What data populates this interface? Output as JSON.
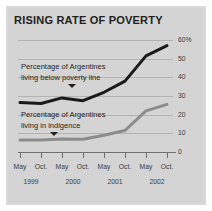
{
  "title": "RISING RATE OF POVERTY",
  "colors": {
    "panel_background": "#d4d4d4",
    "poverty_line": "#1a1a1a",
    "indigence_line": "#8c8c8c",
    "gridline": "#b3b3b3",
    "axis": "#6e6e6e",
    "text": "#231f20"
  },
  "annotations": {
    "poverty": {
      "line1": "Percentage of Argentines",
      "line2": "living below poverty line"
    },
    "indigence": {
      "line1": "Percentage of Argentines",
      "line2": "living in indigence"
    }
  },
  "chart_data": {
    "type": "line",
    "title": "RISING RATE OF POVERTY",
    "xlabel": "",
    "ylabel": "",
    "ylim": [
      0,
      60
    ],
    "yticks": [
      0,
      10,
      20,
      30,
      40,
      50,
      60
    ],
    "ytick_labels": [
      "0",
      "10",
      "20",
      "30",
      "40",
      "50",
      "60%"
    ],
    "grid": true,
    "legend": "inline-annotations",
    "categories": [
      "May 1999",
      "Oct. 1999",
      "May 2000",
      "Oct. 2000",
      "May 2001",
      "Oct. 2001",
      "May 2002",
      "Oct. 2002"
    ],
    "xtick_labels": [
      "May",
      "Oct.",
      "May",
      "Oct.",
      "May",
      "Oct.",
      "May",
      "Oct."
    ],
    "year_groups": [
      {
        "label": "1999",
        "ticks": [
          0,
          1
        ]
      },
      {
        "label": "2000",
        "ticks": [
          2,
          3
        ]
      },
      {
        "label": "2001",
        "ticks": [
          4,
          5
        ]
      },
      {
        "label": "2002",
        "ticks": [
          6,
          7
        ]
      }
    ],
    "series": [
      {
        "name": "Percentage of Argentines living below poverty line",
        "color": "#1a1a1a",
        "values": [
          26.5,
          26.0,
          29.0,
          27.5,
          32.0,
          38.0,
          51.5,
          57.0
        ]
      },
      {
        "name": "Percentage of Argentines living in indigence",
        "color": "#8c8c8c",
        "values": [
          6.5,
          6.5,
          7.0,
          6.8,
          9.0,
          11.5,
          22.0,
          25.5
        ]
      }
    ]
  }
}
